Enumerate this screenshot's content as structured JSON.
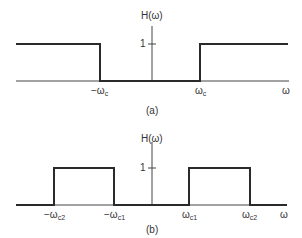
{
  "figure_a": {
    "y_axis_label": "H(ω)",
    "tick_one": "1",
    "x_axis_label": "ω",
    "labels": {
      "neg_cutoff_prefix": "−ω",
      "neg_cutoff_sub": "c",
      "pos_cutoff_prefix": "ω",
      "pos_cutoff_sub": "c"
    },
    "caption": "(a)",
    "type": "high-pass ideal filter"
  },
  "figure_b": {
    "y_axis_label": "H(ω)",
    "tick_one": "1",
    "x_axis_label": "ω",
    "labels": {
      "neg_c2_prefix": "−ω",
      "neg_c2_sub": "c2",
      "neg_c1_prefix": "−ω",
      "neg_c1_sub": "c1",
      "pos_c1_prefix": "ω",
      "pos_c1_sub": "c1",
      "pos_c2_prefix": "ω",
      "pos_c2_sub": "c2"
    },
    "caption": "(b)",
    "type": "band-pass ideal filter"
  },
  "colors": {
    "line": "#2a2a2a",
    "axis": "#444444"
  }
}
